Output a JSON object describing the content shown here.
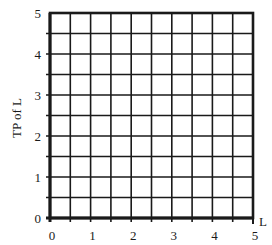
{
  "chart_data": {
    "type": "line",
    "title": "",
    "xlabel": "L",
    "ylabel": "TP of L",
    "xlim": [
      0,
      5
    ],
    "ylim": [
      0,
      5
    ],
    "x_ticks": [
      "0",
      "1",
      "2",
      "3",
      "4",
      "5"
    ],
    "y_ticks": [
      "0",
      "1",
      "2",
      "3",
      "4",
      "5"
    ],
    "grid": true,
    "grid_step": 0.5,
    "series": [],
    "legend": null,
    "note": "Blank grid for plotting total product of labor; no data plotted"
  },
  "colors": {
    "grid": "#1a1a1a",
    "background": "#ffffff"
  }
}
